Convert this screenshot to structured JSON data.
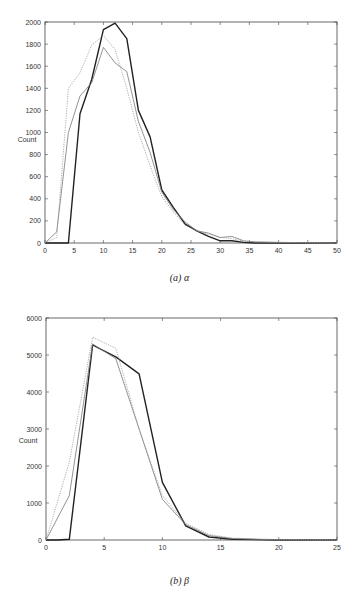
{
  "chart_data": [
    {
      "type": "line",
      "caption": "(a) α",
      "xlabel": "",
      "ylabel": "Count",
      "xlim": [
        0,
        50
      ],
      "ylim": [
        0,
        2000
      ],
      "xticks": [
        0,
        5,
        10,
        15,
        20,
        25,
        30,
        35,
        40,
        45,
        50
      ],
      "yticks": [
        0,
        200,
        400,
        600,
        800,
        1000,
        1200,
        1400,
        1600,
        1800,
        2000
      ],
      "grid": false,
      "legend": "none",
      "series": [
        {
          "name": "dark-solid",
          "color": "#222222",
          "style": "solid",
          "x": [
            0,
            2,
            4,
            6,
            8,
            10,
            12,
            14,
            16,
            18,
            20,
            22,
            24,
            26,
            28,
            30,
            32,
            34,
            36,
            40,
            50
          ],
          "values": [
            0,
            0,
            0,
            1170,
            1480,
            1930,
            1990,
            1850,
            1200,
            960,
            480,
            320,
            170,
            110,
            60,
            20,
            20,
            5,
            0,
            0,
            0
          ]
        },
        {
          "name": "gray-solid",
          "color": "#777777",
          "style": "solid",
          "x": [
            0,
            2,
            4,
            6,
            8,
            10,
            12,
            14,
            16,
            18,
            20,
            22,
            24,
            26,
            28,
            30,
            32,
            34,
            36,
            40,
            50
          ],
          "values": [
            0,
            100,
            1000,
            1330,
            1450,
            1770,
            1630,
            1550,
            1100,
            820,
            460,
            300,
            190,
            110,
            90,
            50,
            60,
            20,
            10,
            5,
            0
          ]
        },
        {
          "name": "dotted",
          "color": "#999999",
          "style": "dotted",
          "x": [
            0,
            2,
            4,
            6,
            8,
            10,
            12,
            14,
            16,
            18,
            20,
            22,
            24,
            26,
            28,
            30,
            32,
            34,
            36,
            40,
            50
          ],
          "values": [
            0,
            50,
            1400,
            1540,
            1790,
            1880,
            1750,
            1400,
            1000,
            700,
            420,
            280,
            160,
            110,
            80,
            50,
            40,
            15,
            10,
            5,
            0
          ]
        }
      ]
    },
    {
      "type": "line",
      "caption": "(b) β",
      "xlabel": "",
      "ylabel": "Count",
      "xlim": [
        0,
        25
      ],
      "ylim": [
        0,
        6000
      ],
      "xticks": [
        0,
        5,
        10,
        15,
        20,
        25
      ],
      "yticks": [
        0,
        1000,
        2000,
        3000,
        4000,
        5000,
        6000
      ],
      "grid": false,
      "legend": "none",
      "series": [
        {
          "name": "dark-solid",
          "color": "#222222",
          "style": "solid",
          "x": [
            0,
            1,
            2,
            4,
            6,
            8,
            10,
            12,
            14,
            16,
            20,
            25
          ],
          "values": [
            0,
            0,
            20,
            5270,
            4950,
            4490,
            1560,
            380,
            80,
            20,
            0,
            0
          ]
        },
        {
          "name": "gray-solid",
          "color": "#777777",
          "style": "solid",
          "x": [
            0,
            2,
            4,
            6,
            8,
            10,
            12,
            14,
            16,
            20,
            25
          ],
          "values": [
            0,
            1200,
            5300,
            4900,
            3000,
            1100,
            420,
            120,
            40,
            0,
            0
          ]
        },
        {
          "name": "dotted",
          "color": "#999999",
          "style": "dotted",
          "x": [
            0,
            2,
            4,
            6,
            8,
            10,
            12,
            14,
            16,
            20,
            25
          ],
          "values": [
            0,
            2100,
            5480,
            5180,
            3000,
            1200,
            450,
            150,
            50,
            10,
            0
          ]
        }
      ]
    }
  ]
}
